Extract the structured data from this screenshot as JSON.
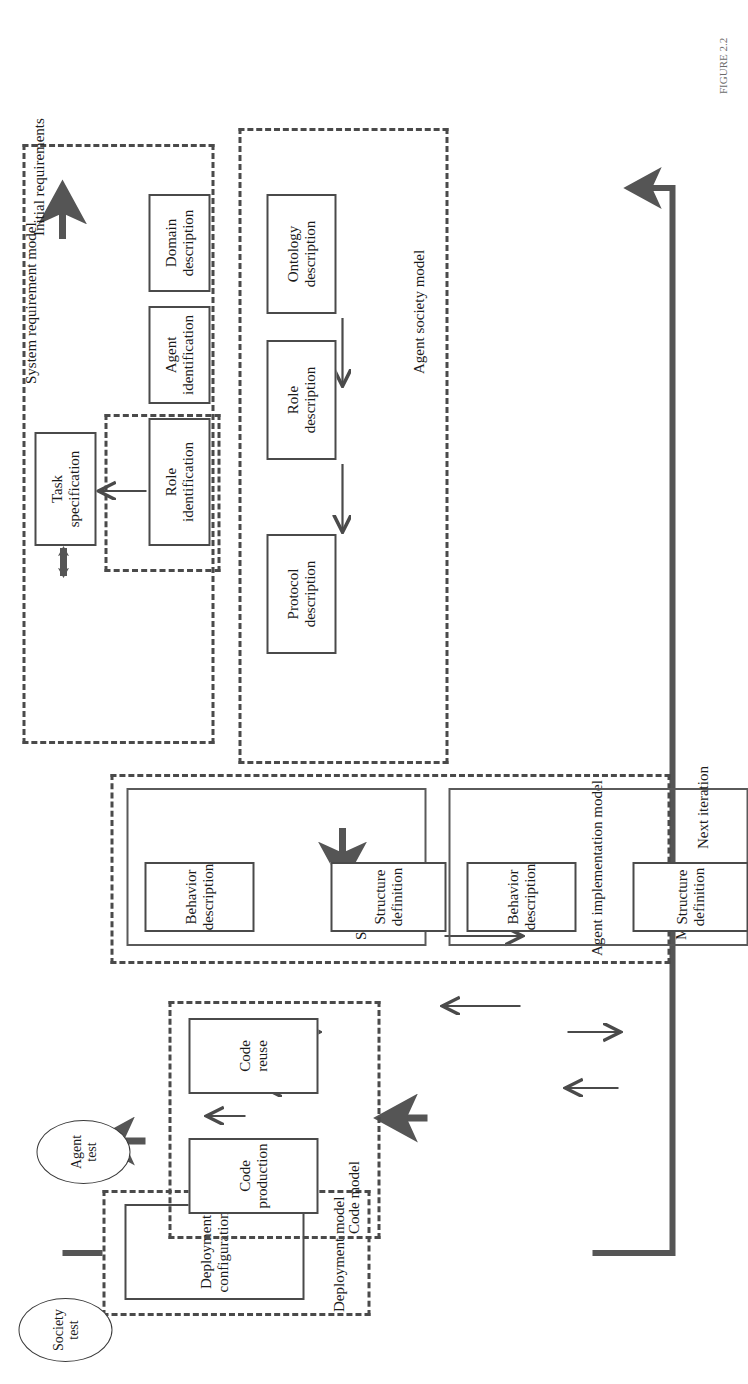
{
  "figure": {
    "orientation": "rotated-90-ccw",
    "caption": "FIGURE 2.2"
  },
  "flow_labels": {
    "initial_requirements": "Initial requirements",
    "next_iteration": "Next iteration"
  },
  "tests": [
    {
      "id": "agent-test",
      "line1": "Agent",
      "line2": "test"
    },
    {
      "id": "society-test",
      "line1": "Society",
      "line2": "test"
    }
  ],
  "groups": [
    {
      "id": "system-requirement-model",
      "label": "System requirement model"
    },
    {
      "id": "agent-society-model",
      "label": "Agent society model"
    },
    {
      "id": "agent-implementation-model",
      "label": "Agent implementation model"
    },
    {
      "id": "code-model",
      "label": "Code model"
    },
    {
      "id": "deployment-model",
      "label": "Deployment model"
    },
    {
      "id": "role-task-link",
      "label": ""
    }
  ],
  "subgroups": [
    {
      "id": "single-agent",
      "label": "Single agent"
    },
    {
      "id": "multiagent",
      "label": "Multiagent"
    }
  ],
  "nodes": {
    "domain_description": {
      "line1": "Domain",
      "line2": "description"
    },
    "agent_identification": {
      "line1": "Agent",
      "line2": "identification"
    },
    "role_identification": {
      "line1": "Role",
      "line2": "identification"
    },
    "task_specification": {
      "line1": "Task",
      "line2": "specification"
    },
    "ontology_description": {
      "line1": "Ontology",
      "line2": "description"
    },
    "role_description": {
      "line1": "Role",
      "line2": "description"
    },
    "protocol_description": {
      "line1": "Protocol",
      "line2": "description"
    },
    "sa_structure_definition": {
      "line1": "Structure",
      "line2": "definition"
    },
    "sa_behavior_description": {
      "line1": "Behavior",
      "line2": "description"
    },
    "ma_structure_definition": {
      "line1": "Structure",
      "line2": "definition"
    },
    "ma_behavior_description": {
      "line1": "Behavior",
      "line2": "description"
    },
    "code_reuse": {
      "line1": "Code",
      "line2": "reuse"
    },
    "code_production": {
      "line1": "Code",
      "line2": "production"
    },
    "deployment_configuration": {
      "line1": "Deployment",
      "line2": "configuration"
    }
  },
  "colors": {
    "stroke": "#4a4a4a",
    "thick_stroke": "#555555",
    "text": "#1a1a1a",
    "background": "#ffffff"
  }
}
